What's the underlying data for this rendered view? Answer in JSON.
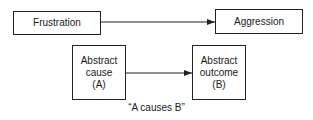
{
  "top_row": {
    "source": {
      "label": "Frustration"
    },
    "target": {
      "label": "Aggression"
    }
  },
  "bottom_row": {
    "source": {
      "lines": [
        "Abstract",
        "cause",
        "(A)"
      ]
    },
    "target": {
      "lines": [
        "Abstract",
        "outcome",
        "(B)"
      ]
    }
  },
  "caption": "“A causes B”",
  "colors": {
    "line": "#222222",
    "text": "#1a1a1a",
    "background": "#ffffff"
  }
}
